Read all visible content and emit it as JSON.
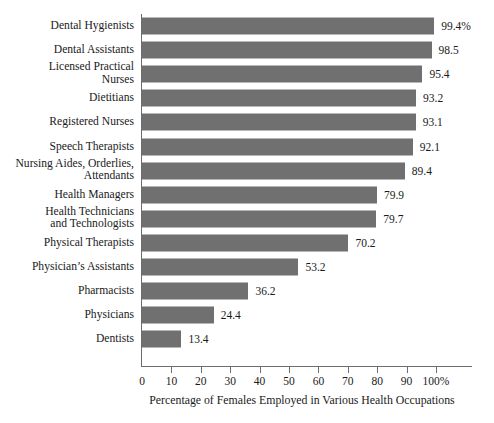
{
  "chart_data": {
    "type": "bar",
    "orientation": "horizontal",
    "title": "",
    "xlabel": "Percentage of Females Employed in Various Health Occupations",
    "ylabel": "",
    "xlim": [
      0,
      100
    ],
    "grid": false,
    "legend": null,
    "bar_color": "#707070",
    "axis_color": "#6d6d6d",
    "xticks": [
      {
        "value": 0,
        "label": "0"
      },
      {
        "value": 10,
        "label": "10"
      },
      {
        "value": 20,
        "label": "20"
      },
      {
        "value": 30,
        "label": "30"
      },
      {
        "value": 40,
        "label": "40"
      },
      {
        "value": 50,
        "label": "50"
      },
      {
        "value": 60,
        "label": "60"
      },
      {
        "value": 70,
        "label": "70"
      },
      {
        "value": 80,
        "label": "80"
      },
      {
        "value": 90,
        "label": "90"
      },
      {
        "value": 100,
        "label": "100%"
      }
    ],
    "categories": [
      "Dental Hygienists",
      "Dental Assistants",
      "Licensed Practical\nNurses",
      "Dietitians",
      "Registered Nurses",
      "Speech Therapists",
      "Nursing Aides, Orderlies,\nAttendants",
      "Health Managers",
      "Health Technicians\nand Technologists",
      "Physical Therapists",
      "Physician’s Assistants",
      "Pharmacists",
      "Physicians",
      "Dentists"
    ],
    "values": [
      99.4,
      98.5,
      95.4,
      93.2,
      93.1,
      92.1,
      89.4,
      79.9,
      79.7,
      70.2,
      53.2,
      36.2,
      24.4,
      13.4
    ],
    "value_labels": [
      "99.4%",
      "98.5",
      "95.4",
      "93.2",
      "93.1",
      "92.1",
      "89.4",
      "79.9",
      "79.7",
      "70.2",
      "53.2",
      "36.2",
      "24.4",
      "13.4"
    ]
  }
}
